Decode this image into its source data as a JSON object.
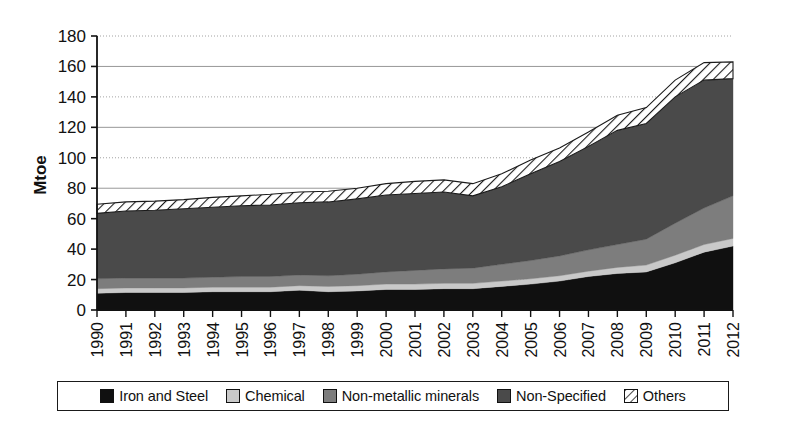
{
  "chart_data": {
    "type": "area",
    "stacked": true,
    "title": "",
    "xlabel": "",
    "ylabel": "Mtoe",
    "ylim": [
      0,
      180
    ],
    "ytick_step": 20,
    "yticks": [
      0,
      20,
      40,
      60,
      80,
      100,
      120,
      140,
      160,
      180
    ],
    "grid": true,
    "legend_position": "bottom",
    "categories": [
      "1990",
      "1991",
      "1992",
      "1993",
      "1994",
      "1995",
      "1996",
      "1997",
      "1998",
      "1999",
      "2000",
      "2001",
      "2002",
      "2003",
      "2004",
      "2005",
      "2006",
      "2007",
      "2008",
      "2009",
      "2010",
      "2011",
      "2012"
    ],
    "series": [
      {
        "name": "Iron and Steel",
        "color": "#101010",
        "pattern": "solid",
        "values": [
          11,
          11.5,
          11.5,
          11.5,
          12,
          12,
          12,
          13,
          12,
          12.5,
          13.5,
          13.5,
          14,
          14,
          15.5,
          17,
          19,
          22,
          24,
          25,
          31,
          38,
          42
        ]
      },
      {
        "name": "Chemical",
        "color": "#c9c9c9",
        "pattern": "solid",
        "values": [
          3,
          3,
          3,
          3,
          3,
          3,
          3,
          3,
          3.5,
          3.5,
          3.5,
          3.5,
          3.5,
          3.5,
          3.5,
          3.5,
          3.5,
          3.5,
          4,
          4.5,
          5,
          5,
          5
        ]
      },
      {
        "name": "Non-metallic minerals",
        "color": "#7d7d7d",
        "pattern": "solid",
        "values": [
          6.5,
          6.5,
          6.5,
          6.5,
          6.5,
          7,
          7,
          7,
          7,
          7.5,
          8,
          9,
          9.5,
          10,
          11,
          12,
          13,
          14,
          15,
          17,
          21,
          24,
          28
        ]
      },
      {
        "name": "Non-Specified",
        "color": "#4a4a4a",
        "pattern": "solid",
        "values": [
          43,
          44,
          44.5,
          45.5,
          46,
          46.5,
          47,
          47.5,
          48.5,
          49.5,
          50.5,
          50.5,
          50.5,
          47.5,
          51,
          57,
          62,
          68,
          75,
          76,
          83,
          84,
          77
        ]
      },
      {
        "name": "Others",
        "color": "#ffffff",
        "pattern": "hatch",
        "values": [
          6,
          6,
          6,
          6,
          6.5,
          6.5,
          7,
          7,
          7,
          7,
          7.5,
          8,
          8,
          8,
          8.5,
          9,
          9,
          9.5,
          10,
          10.5,
          11,
          11.5,
          11
        ]
      }
    ],
    "totals": [
      69.5,
      71,
      71.5,
      72.5,
      74,
      75,
      76,
      77.5,
      78,
      80,
      83,
      84.5,
      85.5,
      83,
      89.5,
      98.5,
      106.5,
      117,
      128,
      133,
      151,
      162.5,
      163
    ]
  },
  "axes": {
    "y_axis_title": "Mtoe",
    "y_tick_labels": [
      "180",
      "160",
      "140",
      "120",
      "100",
      "80",
      "60",
      "40",
      "20",
      "0"
    ],
    "x_tick_labels": [
      "1990",
      "1991",
      "1992",
      "1993",
      "1994",
      "1995",
      "1996",
      "1997",
      "1998",
      "1999",
      "2000",
      "2001",
      "2002",
      "2003",
      "2004",
      "2005",
      "2006",
      "2007",
      "2008",
      "2009",
      "2010",
      "2011",
      "2012"
    ]
  },
  "legend": {
    "items": [
      {
        "label": "Iron and Steel",
        "swatch": "iron-and-steel-swatch",
        "color": "#101010",
        "pattern": "solid"
      },
      {
        "label": "Chemical",
        "swatch": "chemical-swatch",
        "color": "#c9c9c9",
        "pattern": "solid"
      },
      {
        "label": "Non-metallic minerals",
        "swatch": "non-metallic-minerals-swatch",
        "color": "#7d7d7d",
        "pattern": "solid"
      },
      {
        "label": "Non-Specified",
        "swatch": "non-specified-swatch",
        "color": "#4a4a4a",
        "pattern": "solid"
      },
      {
        "label": "Others",
        "swatch": "others-swatch",
        "color": "#ffffff",
        "pattern": "hatch"
      }
    ]
  }
}
